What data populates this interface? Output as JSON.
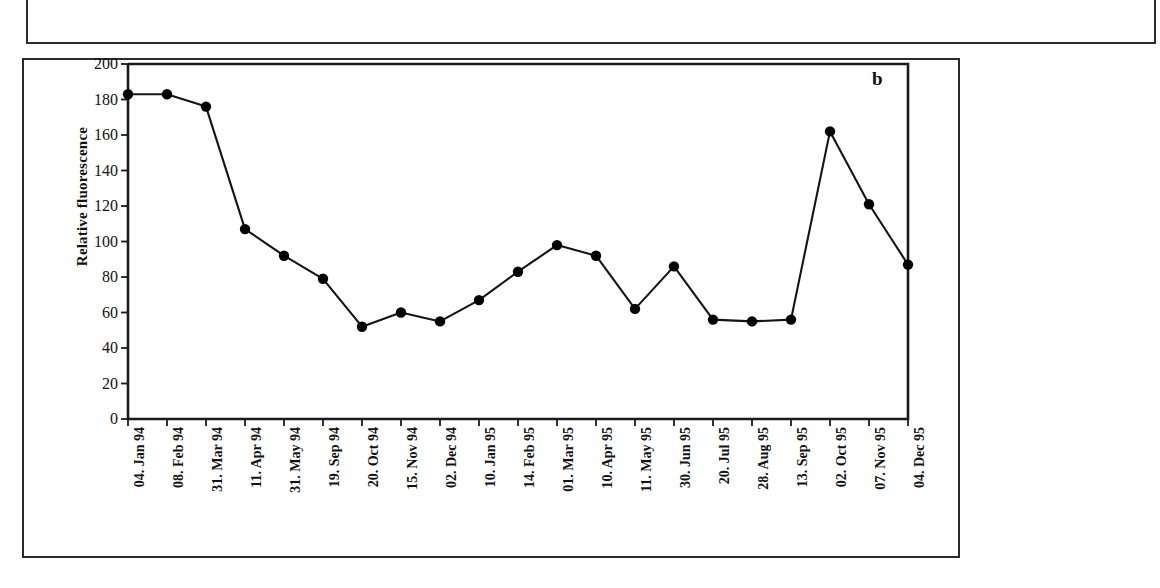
{
  "figure": {
    "panel_label": "b",
    "partial_panel_above": true
  },
  "chart_data": {
    "type": "line",
    "title": "",
    "xlabel": "",
    "ylabel": "Relative fluorescence",
    "ylim": [
      0,
      200
    ],
    "ytick_step": 20,
    "yticks": [
      0,
      20,
      40,
      60,
      80,
      100,
      120,
      140,
      160,
      180,
      200
    ],
    "ytick_labels": [
      "0",
      "20",
      "40",
      "60",
      "80",
      "100",
      "120",
      "140",
      "160",
      "180",
      "200"
    ],
    "grid": false,
    "legend": null,
    "marker": "filled-circle",
    "marker_color": "#000000",
    "line_color": "#000000",
    "categories": [
      "04. Jan 94",
      "08. Feb 94",
      "31. Mar 94",
      "11. Apr 94",
      "31. May 94",
      "19. Sep 94",
      "20. Oct 94",
      "15. Nov 94",
      "02. Dec 94",
      "10. Jan 95",
      "14. Feb 95",
      "01. Mar 95",
      "10. Apr 95",
      "11. May 95",
      "30. Jun 95",
      "20. Jul 95",
      "28. Aug 95",
      "13. Sep 95",
      "02. Oct 95",
      "07. Nov 95",
      "04. Dec 95"
    ],
    "values": [
      183,
      183,
      176,
      107,
      92,
      79,
      52,
      60,
      55,
      67,
      83,
      98,
      92,
      62,
      86,
      56,
      55,
      56,
      162,
      121,
      87
    ]
  }
}
